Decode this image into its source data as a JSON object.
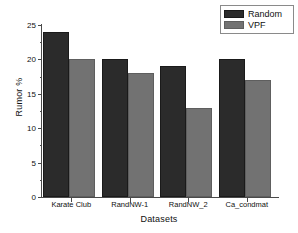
{
  "chart_data": {
    "type": "bar",
    "title": "",
    "xlabel": "Datasets",
    "ylabel": "Rumor %",
    "categories": [
      "Karate Club",
      "RandNW-1",
      "RandNW_2",
      "Ca_condmat"
    ],
    "series": [
      {
        "name": "Random",
        "values": [
          24,
          20,
          19,
          20
        ],
        "color": "#2b2b2b"
      },
      {
        "name": "VPF",
        "values": [
          20,
          18,
          13,
          17
        ],
        "color": "#727272"
      }
    ],
    "ylim": [
      0,
      25
    ],
    "ytick_values": [
      0,
      5,
      10,
      15,
      20,
      25
    ],
    "ytick_labels": [
      "0",
      "5",
      "10",
      "15",
      "20",
      "25"
    ],
    "yminor_values": [
      2.5,
      7.5,
      12.5,
      17.5,
      22.5
    ],
    "grid": false,
    "legend_position": "top-right",
    "legend": [
      "Random",
      "VPF"
    ]
  },
  "axes": {
    "ylabel": "Rumor %",
    "xlabel": "Datasets"
  },
  "legend": {
    "entries": [
      {
        "label": "Random"
      },
      {
        "label": "VPF"
      }
    ]
  }
}
